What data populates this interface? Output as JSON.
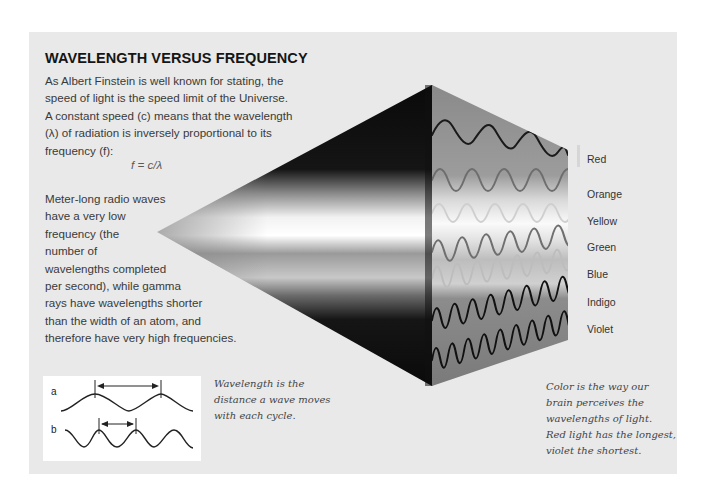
{
  "title": "WAVELENGTH VERSUS FREQUENCY",
  "intro_text": "As Albert Finstein is well known for stating, the speed of light is the speed limit of the Universe. A constant speed (c) means that the wavelength (λ) of radiation is inversely proportional to its frequency (f):",
  "formula": "f = c/λ",
  "body_lines": [
    "Meter-long radio waves",
    "have a very low",
    "frequency (the",
    "number of",
    "wavelengths completed",
    "per second), while gamma",
    "rays have wavelengths shorter",
    "than the width of an atom, and",
    "therefore have very high frequencies."
  ],
  "spectrum_labels": [
    {
      "name": "Red",
      "y": 160
    },
    {
      "name": "Orange",
      "y": 194
    },
    {
      "name": "Yellow",
      "y": 221
    },
    {
      "name": "Green",
      "y": 248
    },
    {
      "name": "Blue",
      "y": 276
    },
    {
      "name": "Indigo",
      "y": 303
    },
    {
      "name": "Violet",
      "y": 331
    }
  ],
  "wavelength_diagram": {
    "label_a": "a",
    "label_b": "b"
  },
  "caption_wavelength": [
    "Wavelength is the",
    "distance a wave moves",
    "with each cycle."
  ],
  "caption_color": [
    "Color is the way our",
    "brain perceives the",
    "wavelengths of light.",
    "Red light has the longest,",
    "violet the shortest."
  ]
}
